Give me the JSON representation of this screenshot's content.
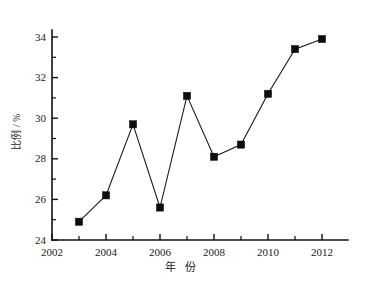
{
  "chart_data": {
    "type": "line",
    "title": "",
    "xlabel": "年 份",
    "ylabel": "比例 / %",
    "xlim": [
      2002,
      2013
    ],
    "ylim": [
      24,
      34.8
    ],
    "grid": false,
    "legend": null,
    "x": [
      2003,
      2004,
      2005,
      2006,
      2007,
      2008,
      2009,
      2010,
      2011,
      2012
    ],
    "values": [
      24.9,
      26.2,
      29.7,
      25.6,
      31.1,
      28.1,
      28.7,
      31.2,
      33.4,
      33.9
    ],
    "series": [
      {
        "name": "比例",
        "marker": "filled-square",
        "color": "#0d0d0d",
        "values": [
          24.9,
          26.2,
          29.7,
          25.6,
          31.1,
          28.1,
          28.7,
          31.2,
          33.4,
          33.9
        ]
      }
    ],
    "x_ticks_major": [
      2002,
      2004,
      2006,
      2008,
      2010,
      2012
    ],
    "x_ticks_minor": [
      2003,
      2005,
      2007,
      2009,
      2011,
      2013
    ],
    "x_tick_labels": [
      "2002",
      "2004",
      "2006",
      "2008",
      "2010",
      "2012"
    ],
    "y_ticks_major": [
      24,
      26,
      28,
      30,
      32,
      34
    ],
    "y_ticks_minor": [
      25,
      27,
      29,
      31,
      33
    ],
    "y_tick_labels": [
      "24",
      "26",
      "28",
      "30",
      "32",
      "34"
    ],
    "axis_color": "#111111",
    "line_color": "#1a1a1a",
    "background": "#ffffff"
  }
}
